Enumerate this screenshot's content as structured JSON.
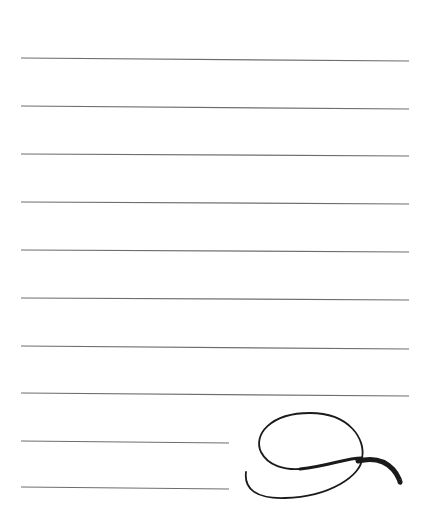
{
  "page": {
    "background": "#ffffff",
    "line_color": "#6e6e6e",
    "ink_color": "#1a1a1a"
  },
  "ruled_lines": [
    {
      "x1": 21,
      "y1": 58,
      "x2": 409,
      "y2": 61
    },
    {
      "x1": 21,
      "y1": 106,
      "x2": 409,
      "y2": 109
    },
    {
      "x1": 21,
      "y1": 154,
      "x2": 409,
      "y2": 156
    },
    {
      "x1": 21,
      "y1": 202,
      "x2": 409,
      "y2": 204
    },
    {
      "x1": 21,
      "y1": 250,
      "x2": 409,
      "y2": 252
    },
    {
      "x1": 21,
      "y1": 298,
      "x2": 409,
      "y2": 300
    },
    {
      "x1": 21,
      "y1": 346,
      "x2": 409,
      "y2": 349
    },
    {
      "x1": 21,
      "y1": 393,
      "x2": 409,
      "y2": 396
    },
    {
      "x1": 21,
      "y1": 441,
      "x2": 229,
      "y2": 443
    },
    {
      "x1": 21,
      "y1": 487,
      "x2": 229,
      "y2": 489
    }
  ],
  "ornament": {
    "name": "calligraphic-flourish"
  }
}
